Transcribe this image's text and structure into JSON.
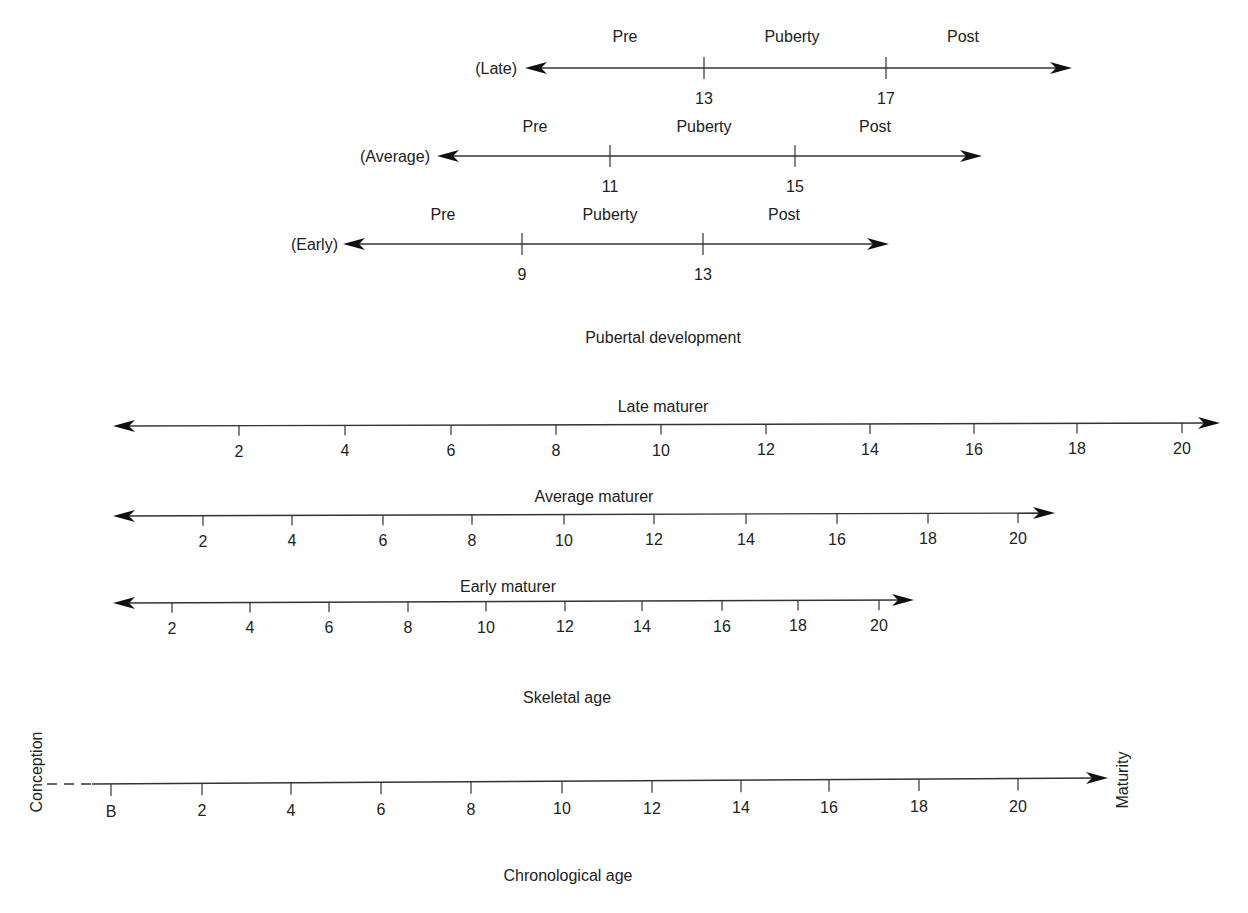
{
  "diagram": {
    "pubertal": {
      "section_label": "Pubertal development",
      "label_pos": [
        663,
        343
      ],
      "rows": [
        {
          "name": "late",
          "label": "(Late)",
          "label_x": 517,
          "y": 68,
          "x_start": 525,
          "x_end": 1072,
          "phases": [
            {
              "text": "Pre",
              "x": 625
            },
            {
              "text": "Puberty",
              "x": 792
            },
            {
              "text": "Post",
              "x": 963
            }
          ],
          "phase_y": 42,
          "ticks": [
            {
              "x": 704,
              "label": "13"
            },
            {
              "x": 886,
              "label": "17"
            }
          ]
        },
        {
          "name": "average",
          "label": "(Average)",
          "label_x": 430,
          "y": 156,
          "x_start": 437,
          "x_end": 982,
          "phases": [
            {
              "text": "Pre",
              "x": 535
            },
            {
              "text": "Puberty",
              "x": 704
            },
            {
              "text": "Post",
              "x": 875
            }
          ],
          "phase_y": 132,
          "ticks": [
            {
              "x": 610,
              "label": "11"
            },
            {
              "x": 795,
              "label": "15"
            }
          ]
        },
        {
          "name": "early",
          "label": "(Early)",
          "label_x": 338,
          "y": 244,
          "x_start": 343,
          "x_end": 889,
          "phases": [
            {
              "text": "Pre",
              "x": 443
            },
            {
              "text": "Puberty",
              "x": 610
            },
            {
              "text": "Post",
              "x": 784
            }
          ],
          "phase_y": 220,
          "ticks": [
            {
              "x": 522,
              "label": "9"
            },
            {
              "x": 703,
              "label": "13"
            }
          ]
        }
      ]
    },
    "skeletal": {
      "section_label": "Skeletal age",
      "label_pos": [
        567,
        703
      ],
      "rows": [
        {
          "name": "late-maturer",
          "title": "Late maturer",
          "title_x": 663,
          "title_y": 412,
          "y": 426,
          "x_start": 113,
          "x_end": 1220,
          "ticks": [
            {
              "x": 239,
              "label": "2"
            },
            {
              "x": 345,
              "label": "4"
            },
            {
              "x": 451,
              "label": "6"
            },
            {
              "x": 556,
              "label": "8"
            },
            {
              "x": 661,
              "label": "10"
            },
            {
              "x": 766,
              "label": "12"
            },
            {
              "x": 870,
              "label": "14"
            },
            {
              "x": 974,
              "label": "16"
            },
            {
              "x": 1077,
              "label": "18"
            },
            {
              "x": 1182,
              "label": "20"
            }
          ]
        },
        {
          "name": "average-maturer",
          "title": "Average maturer",
          "title_x": 594,
          "title_y": 502,
          "y": 516,
          "x_start": 113,
          "x_end": 1055,
          "ticks": [
            {
              "x": 203,
              "label": "2"
            },
            {
              "x": 292,
              "label": "4"
            },
            {
              "x": 383,
              "label": "6"
            },
            {
              "x": 472,
              "label": "8"
            },
            {
              "x": 564,
              "label": "10"
            },
            {
              "x": 654,
              "label": "12"
            },
            {
              "x": 746,
              "label": "14"
            },
            {
              "x": 837,
              "label": "16"
            },
            {
              "x": 928,
              "label": "18"
            },
            {
              "x": 1018,
              "label": "20"
            }
          ]
        },
        {
          "name": "early-maturer",
          "title": "Early maturer",
          "title_x": 508,
          "title_y": 592,
          "y": 603,
          "x_start": 113,
          "x_end": 914,
          "ticks": [
            {
              "x": 172,
              "label": "2"
            },
            {
              "x": 250,
              "label": "4"
            },
            {
              "x": 329,
              "label": "6"
            },
            {
              "x": 408,
              "label": "8"
            },
            {
              "x": 486,
              "label": "10"
            },
            {
              "x": 565,
              "label": "12"
            },
            {
              "x": 642,
              "label": "14"
            },
            {
              "x": 722,
              "label": "16"
            },
            {
              "x": 798,
              "label": "18"
            },
            {
              "x": 879,
              "label": "20"
            }
          ]
        }
      ]
    },
    "chronological": {
      "section_label": "Chronological age",
      "label_pos": [
        568,
        881
      ],
      "start_label": "Conception",
      "start_label_pos": [
        36,
        772
      ],
      "end_label": "Maturity",
      "end_label_pos": [
        1122,
        780
      ],
      "y": 782,
      "dash_x_start": 47,
      "dash_x_end": 92,
      "x_start": 92,
      "x_end": 1108,
      "ticks": [
        {
          "x": 111,
          "label": "B"
        },
        {
          "x": 202,
          "label": "2"
        },
        {
          "x": 291,
          "label": "4"
        },
        {
          "x": 381,
          "label": "6"
        },
        {
          "x": 471,
          "label": "8"
        },
        {
          "x": 562,
          "label": "10"
        },
        {
          "x": 652,
          "label": "12"
        },
        {
          "x": 741,
          "label": "14"
        },
        {
          "x": 829,
          "label": "16"
        },
        {
          "x": 919,
          "label": "18"
        },
        {
          "x": 1018,
          "label": "20"
        }
      ]
    }
  }
}
